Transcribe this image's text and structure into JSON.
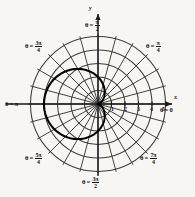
{
  "figure": {
    "background_color": "#f7f6f2",
    "ink_color": "#111111",
    "grid_color": "#3a3a3a",
    "curve_color": "#000000"
  },
  "axes": {
    "x_label": "x",
    "y_label": "y",
    "origin": {
      "x": 98,
      "y": 104
    },
    "unit_px": 13.5,
    "outer_radius_units": 5.2
  },
  "angle_labels": [
    {
      "name": "theta-0",
      "prefix": "θ = ",
      "value": "0",
      "kind": "plain",
      "x": 160,
      "y": 107
    },
    {
      "name": "theta-pi-4",
      "prefix": "θ = ",
      "num": "π",
      "den": "4",
      "kind": "fraction",
      "x": 146,
      "y": 40
    },
    {
      "name": "theta-pi-2",
      "prefix": "θ = ",
      "num": "π",
      "den": "2",
      "kind": "fraction",
      "x": 85,
      "y": 19
    },
    {
      "name": "theta-3pi-4",
      "prefix": "θ = ",
      "num": "3π",
      "den": "4",
      "kind": "fraction",
      "x": 25,
      "y": 40
    },
    {
      "name": "theta-pi",
      "prefix": "θ = ",
      "value": "π",
      "kind": "plain",
      "x": 5,
      "y": 101
    },
    {
      "name": "theta-5pi-4",
      "prefix": "θ = ",
      "num": "5π",
      "den": "4",
      "kind": "fraction",
      "x": 25,
      "y": 152
    },
    {
      "name": "theta-3pi-2",
      "prefix": "θ = ",
      "num": "3π",
      "den": "2",
      "kind": "fraction",
      "x": 82,
      "y": 176
    },
    {
      "name": "theta-7pi-4",
      "prefix": "θ = ",
      "num": "7π",
      "den": "4",
      "kind": "fraction",
      "x": 140,
      "y": 152
    }
  ],
  "radial_ticks": [
    {
      "label": "1",
      "value": 1,
      "x": 111,
      "y": 106
    },
    {
      "label": "2",
      "value": 2,
      "x": 124,
      "y": 106
    },
    {
      "label": "3",
      "value": 3,
      "x": 137,
      "y": 106
    },
    {
      "label": "4",
      "value": 4,
      "x": 150,
      "y": 106
    },
    {
      "label": "5",
      "value": 5,
      "x": 162,
      "y": 106
    }
  ],
  "chart_data": {
    "type": "line",
    "coordinate_system": "polar",
    "title": "",
    "xlabel": "x",
    "ylabel": "y",
    "grid": true,
    "legend": null,
    "polar_grid": {
      "radial_circles": [
        1,
        2,
        3,
        4,
        5
      ],
      "angular_spokes_deg": [
        0,
        15,
        30,
        45,
        60,
        75,
        90,
        105,
        120,
        135,
        150,
        165,
        180,
        195,
        210,
        225,
        240,
        255,
        270,
        285,
        300,
        315,
        330,
        345
      ],
      "r_max": 5.2,
      "theta_tick_labels": [
        "0",
        "π/4",
        "π/2",
        "3π/4",
        "π",
        "5π/4",
        "3π/2",
        "7π/4"
      ]
    },
    "curve": {
      "name": "cardioid",
      "equation": "r = 2(1 - cos θ)",
      "a": 2.0,
      "theta": [
        0,
        15,
        30,
        45,
        60,
        75,
        90,
        105,
        120,
        135,
        150,
        165,
        180,
        195,
        210,
        225,
        240,
        255,
        270,
        285,
        300,
        315,
        330,
        345,
        360
      ],
      "r": [
        0.0,
        0.07,
        0.27,
        0.59,
        1.0,
        1.48,
        2.0,
        2.52,
        3.0,
        3.41,
        3.73,
        3.93,
        4.0,
        3.93,
        3.73,
        3.41,
        3.0,
        2.52,
        2.0,
        1.48,
        1.0,
        0.59,
        0.27,
        0.07,
        0.0
      ]
    }
  }
}
